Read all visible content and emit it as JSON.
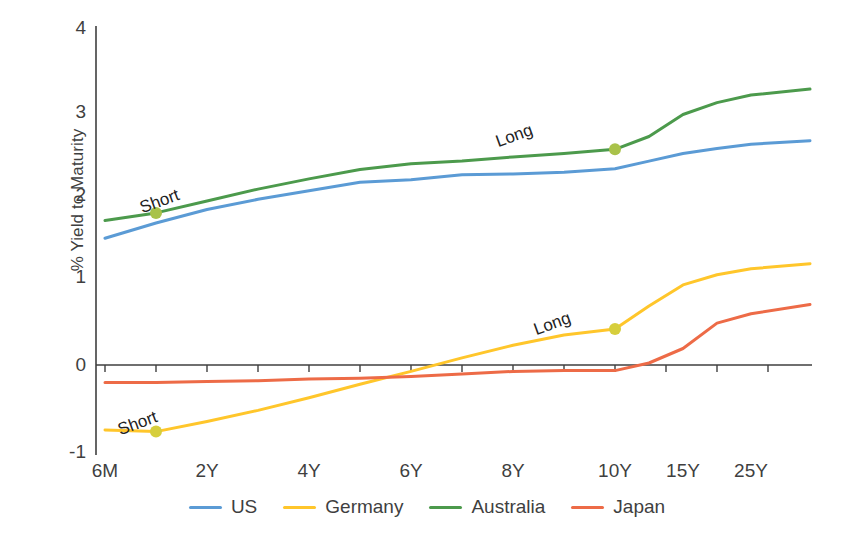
{
  "chart_data": {
    "type": "line",
    "title": "",
    "xlabel": "",
    "ylabel": "% Yield to Maturity",
    "ylim": [
      -1,
      4
    ],
    "yticks": [
      4,
      3,
      2,
      1,
      0,
      -1
    ],
    "grid": false,
    "legend_position": "bottom",
    "x_tick_labels": [
      "6M",
      "2Y",
      "4Y",
      "6Y",
      "8Y",
      "10Y",
      "15Y",
      "25Y"
    ],
    "x_positions": [
      105,
      207,
      309,
      411,
      513,
      615,
      683,
      751
    ],
    "categories": [
      "6M",
      "1Y",
      "2Y",
      "3Y",
      "4Y",
      "5Y",
      "6Y",
      "7Y",
      "8Y",
      "9Y",
      "10Y",
      "12Y",
      "15Y",
      "20Y",
      "25Y",
      "30Y"
    ],
    "series": [
      {
        "name": "US",
        "color": "#5B9BD5",
        "values": [
          1.52,
          1.7,
          1.86,
          1.98,
          2.08,
          2.18,
          2.21,
          2.27,
          2.28,
          2.3,
          2.34,
          2.43,
          2.52,
          2.58,
          2.63,
          2.67
        ]
      },
      {
        "name": "Germany",
        "color": "#FFC62B",
        "values": [
          -0.74,
          -0.76,
          -0.64,
          -0.51,
          -0.36,
          -0.2,
          -0.05,
          0.11,
          0.26,
          0.38,
          0.45,
          0.72,
          0.97,
          1.09,
          1.16,
          1.22
        ]
      },
      {
        "name": "Australia",
        "color": "#4C9A4C",
        "values": [
          1.73,
          1.82,
          1.96,
          2.1,
          2.22,
          2.33,
          2.4,
          2.43,
          2.48,
          2.52,
          2.57,
          2.72,
          2.98,
          3.12,
          3.21,
          3.28
        ]
      },
      {
        "name": "Japan",
        "color": "#ED6B47",
        "values": [
          -0.18,
          -0.18,
          -0.17,
          -0.16,
          -0.14,
          -0.13,
          -0.11,
          -0.08,
          -0.05,
          -0.04,
          -0.04,
          0.05,
          0.22,
          0.52,
          0.63,
          0.74
        ]
      }
    ],
    "annotations": [
      {
        "text": "Short",
        "series": "Australia",
        "x_label": "1Y",
        "value": 1.82,
        "marker_color": "#A9C24A"
      },
      {
        "text": "Long",
        "series": "Australia",
        "x_label": "10Y",
        "value": 2.57,
        "marker_color": "#A9C24A"
      },
      {
        "text": "Short",
        "series": "Germany",
        "x_label": "1Y",
        "value": -0.76,
        "marker_color": "#D6CE3C"
      },
      {
        "text": "Long",
        "series": "Germany",
        "x_label": "10Y",
        "value": 0.45,
        "marker_color": "#D6CE3C"
      }
    ]
  },
  "legend": {
    "items": [
      {
        "label": "US",
        "color": "#5B9BD5"
      },
      {
        "label": "Germany",
        "color": "#FFC62B"
      },
      {
        "label": "Australia",
        "color": "#4C9A4C"
      },
      {
        "label": "Japan",
        "color": "#ED6B47"
      }
    ]
  },
  "axes": {
    "y_label": "% Yield to Maturity",
    "y_ticks": [
      "4",
      "3",
      "2",
      "1",
      "0",
      "-1"
    ],
    "x_ticks": [
      "6M",
      "2Y",
      "4Y",
      "6Y",
      "8Y",
      "10Y",
      "15Y",
      "25Y"
    ]
  },
  "annotation_labels": {
    "aus_short": "Short",
    "aus_long": "Long",
    "ger_short": "Short",
    "ger_long": "Long"
  }
}
